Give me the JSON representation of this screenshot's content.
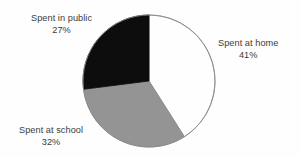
{
  "chart_data": {
    "type": "pie",
    "title": "",
    "subtitle": "",
    "xlabel": "",
    "ylabel": "",
    "legend_position": "none",
    "grid": false,
    "labels_inline": true,
    "units": "%",
    "total": 100,
    "categories": [
      "Spent at home",
      "Spent at school",
      "Spent in public"
    ],
    "values": [
      41,
      32,
      27
    ],
    "slices": [
      {
        "name": "Spent at home",
        "value": 41,
        "value_text": "41%",
        "color": "#fefefe",
        "stroke": "#8a8a8a",
        "start_angle_deg": 0,
        "end_angle_deg": 147.6,
        "label_position": "right"
      },
      {
        "name": "Spent at school",
        "value": 32,
        "value_text": "32%",
        "color": "#949494",
        "stroke": "#8a8a8a",
        "start_angle_deg": 147.6,
        "end_angle_deg": 262.8,
        "label_position": "bottom-left"
      },
      {
        "name": "Spent in public",
        "value": 27,
        "value_text": "27%",
        "color": "#0d0d0d",
        "stroke": "#0d0d0d",
        "start_angle_deg": 262.8,
        "end_angle_deg": 360,
        "label_position": "top-left"
      }
    ],
    "geometry": {
      "center_x": 149,
      "center_y": 81,
      "radius": 66,
      "start_at_twelve_oclock": true,
      "direction": "clockwise"
    },
    "colors": {
      "background": "#fefefe",
      "text": "#3b3b3b",
      "outline": "#8a8a8a",
      "slice_home": "#fefefe",
      "slice_school": "#949494",
      "slice_public": "#0d0d0d"
    }
  }
}
